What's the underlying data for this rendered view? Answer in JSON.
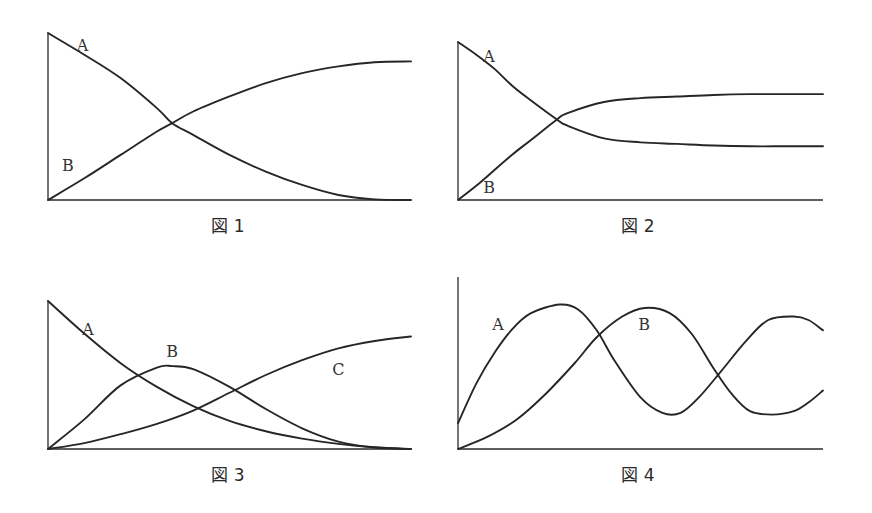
{
  "chart_data": [
    {
      "type": "line",
      "title": "図 1",
      "xlabel": "",
      "ylabel": "",
      "xlim": [
        0,
        10
      ],
      "ylim": [
        0,
        1
      ],
      "grid": false,
      "series": [
        {
          "name": "A",
          "x": [
            0,
            1,
            2,
            3,
            3.42,
            4,
            5,
            6,
            7,
            8,
            9,
            10
          ],
          "y": [
            1.0,
            0.87,
            0.73,
            0.55,
            0.46,
            0.39,
            0.27,
            0.17,
            0.09,
            0.03,
            0.004,
            0.0
          ]
        },
        {
          "name": "B",
          "x": [
            0,
            1,
            2,
            3,
            3.42,
            4,
            5,
            6,
            7,
            8,
            9,
            10
          ],
          "y": [
            0.0,
            0.13,
            0.27,
            0.41,
            0.46,
            0.53,
            0.62,
            0.7,
            0.76,
            0.8,
            0.825,
            0.83
          ]
        }
      ],
      "annotations": [
        {
          "text": "A",
          "x": 0.95,
          "y": 0.92
        },
        {
          "text": "B",
          "x": 0.55,
          "y": 0.2
        }
      ]
    },
    {
      "type": "line",
      "title": "図 2",
      "xlabel": "",
      "ylabel": "",
      "xlim": [
        0,
        10
      ],
      "ylim": [
        0,
        1
      ],
      "grid": false,
      "series": [
        {
          "name": "A",
          "x": [
            0,
            0.5,
            1,
            1.5,
            2,
            2.71,
            3,
            4,
            5,
            6,
            7,
            8,
            9,
            10
          ],
          "y": [
            1.0,
            0.92,
            0.83,
            0.72,
            0.63,
            0.51,
            0.47,
            0.39,
            0.365,
            0.355,
            0.345,
            0.34,
            0.34,
            0.34
          ]
        },
        {
          "name": "B",
          "x": [
            0,
            0.5,
            1,
            1.5,
            2,
            2.71,
            3,
            4,
            5,
            6,
            7,
            8,
            9,
            10
          ],
          "y": [
            0.0,
            0.09,
            0.19,
            0.29,
            0.38,
            0.51,
            0.55,
            0.62,
            0.645,
            0.655,
            0.665,
            0.67,
            0.67,
            0.67
          ]
        }
      ],
      "annotations": [
        {
          "text": "A",
          "x": 0.85,
          "y": 0.9
        },
        {
          "text": "B",
          "x": 0.85,
          "y": 0.07
        }
      ]
    },
    {
      "type": "line",
      "title": "図 3",
      "xlabel": "",
      "ylabel": "",
      "xlim": [
        0,
        10
      ],
      "ylim": [
        0,
        1
      ],
      "grid": false,
      "series": [
        {
          "name": "A",
          "x": [
            0,
            1,
            2,
            3,
            4,
            5,
            6,
            7,
            8,
            9,
            10
          ],
          "y": [
            1.0,
            0.78,
            0.58,
            0.42,
            0.29,
            0.19,
            0.12,
            0.07,
            0.035,
            0.012,
            0.0
          ]
        },
        {
          "name": "B",
          "x": [
            0,
            1,
            2,
            3,
            3.42,
            4,
            5,
            6,
            7,
            8,
            9,
            10
          ],
          "y": [
            0.0,
            0.2,
            0.43,
            0.55,
            0.56,
            0.54,
            0.42,
            0.27,
            0.14,
            0.05,
            0.01,
            0.0
          ]
        },
        {
          "name": "C",
          "x": [
            0,
            1,
            2,
            3,
            4,
            5,
            6,
            7,
            8,
            9,
            10
          ],
          "y": [
            0.0,
            0.04,
            0.1,
            0.17,
            0.26,
            0.38,
            0.5,
            0.6,
            0.68,
            0.73,
            0.76
          ]
        }
      ],
      "annotations": [
        {
          "text": "A",
          "x": 1.1,
          "y": 0.8
        },
        {
          "text": "B",
          "x": 3.42,
          "y": 0.65
        },
        {
          "text": "C",
          "x": 8.0,
          "y": 0.53
        }
      ]
    },
    {
      "type": "line",
      "title": "図 4",
      "xlabel": "",
      "ylabel": "",
      "xlim": [
        0,
        10
      ],
      "ylim": [
        0,
        1
      ],
      "grid": false,
      "series": [
        {
          "name": "A",
          "x": [
            0,
            0.5,
            1,
            1.5,
            2,
            2.79,
            3.3,
            3.8,
            4.3,
            5,
            5.6,
            6.1,
            6.6,
            7.2,
            7.9,
            8.5,
            9.2,
            9.6,
            10
          ],
          "y": [
            0.15,
            0.38,
            0.56,
            0.7,
            0.79,
            0.84,
            0.81,
            0.69,
            0.51,
            0.3,
            0.21,
            0.21,
            0.3,
            0.45,
            0.63,
            0.75,
            0.77,
            0.75,
            0.69
          ]
        },
        {
          "name": "B",
          "x": [
            0,
            0.8,
            1.6,
            2.4,
            3.2,
            3.8,
            4.5,
            5.12,
            5.8,
            6.4,
            7.0,
            7.5,
            8.0,
            8.6,
            9.2,
            9.6,
            10
          ],
          "y": [
            0.0,
            0.07,
            0.17,
            0.32,
            0.5,
            0.65,
            0.77,
            0.82,
            0.79,
            0.67,
            0.47,
            0.32,
            0.22,
            0.2,
            0.22,
            0.27,
            0.34
          ]
        }
      ],
      "annotations": [
        {
          "text": "A",
          "x": 1.1,
          "y": 0.72
        },
        {
          "text": "B",
          "x": 5.1,
          "y": 0.72
        }
      ]
    }
  ]
}
